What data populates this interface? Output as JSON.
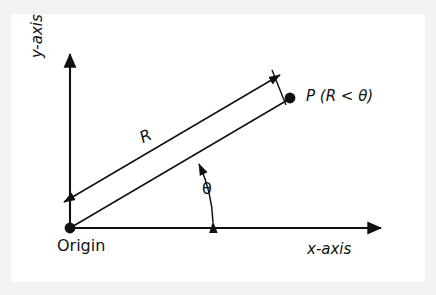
{
  "figure": {
    "background_color": "#f2f2f2",
    "panel_color": "#ffffff",
    "stroke_color": "#111111",
    "labels": {
      "y_axis": "y-axis",
      "y_axis_italic_part": "y",
      "y_axis_plain_part": "-axis",
      "x_axis": "x-axis",
      "x_axis_italic_part": "x",
      "x_axis_plain_part": "-axis",
      "origin": "Origin",
      "point": "P (R < θ)",
      "point_symbol": "P",
      "point_paren": " (R < θ)",
      "theta": "θ",
      "radius": "R"
    },
    "geometry": {
      "origin_point": [
        70,
        228
      ],
      "point_p": [
        290,
        98
      ],
      "y_axis_tip": [
        70,
        50
      ],
      "x_axis_tip": [
        386,
        228
      ],
      "radius_line_angle_deg": 30.6,
      "dimension_arrow_start": [
        62,
        203
      ],
      "dimension_arrow_end": [
        282,
        73
      ],
      "theta_arc_from_deg": 0,
      "theta_arc_to_deg": 30.6
    }
  }
}
